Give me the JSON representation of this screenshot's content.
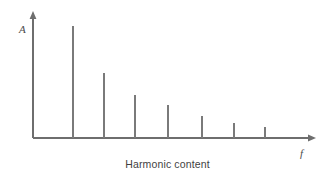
{
  "figure": {
    "caption": "Harmonic content",
    "background_color": "#ffffff",
    "line_color": "#6e6e6e",
    "spike_color": "#7a7a7a",
    "text_color": "#3f3f3f"
  },
  "axes": {
    "y_label": "A",
    "x_label": "f",
    "origin_x": 33,
    "origin_y": 138,
    "x_axis_end": 315,
    "y_axis_top": 12
  },
  "chart_data": {
    "type": "bar",
    "title": "Harmonic content",
    "subtitle": "",
    "xlabel": "f",
    "ylabel": "A",
    "grid": false,
    "legend": false,
    "categories": [
      "1",
      "2",
      "3",
      "4",
      "5",
      "6",
      "7"
    ],
    "x": [
      73,
      104,
      135,
      168,
      202,
      234,
      265
    ],
    "values": [
      112,
      65,
      43,
      33,
      22,
      15,
      11
    ],
    "xlim": [
      33,
      315
    ],
    "ylim": [
      0,
      126
    ],
    "baseline_y": 138,
    "tick_labels_visible": false,
    "annotations": []
  }
}
